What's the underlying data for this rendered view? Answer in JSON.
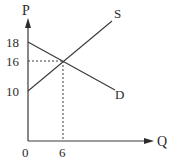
{
  "diagram": {
    "type": "supply-demand",
    "axes": {
      "y_label": "P",
      "x_label": "Q",
      "origin_label": "0"
    },
    "y_ticks": [
      {
        "label": "18",
        "value": 18
      },
      {
        "label": "16",
        "value": 16
      },
      {
        "label": "10",
        "value": 10
      }
    ],
    "x_ticks": [
      {
        "label": "6",
        "value": 6
      }
    ],
    "curves": [
      {
        "name": "S",
        "label": "S",
        "from": [
          0,
          10
        ],
        "direction": "upward"
      },
      {
        "name": "D",
        "label": "D",
        "from": [
          0,
          18
        ],
        "direction": "downward"
      }
    ],
    "equilibrium": {
      "q": 6,
      "p": 16
    },
    "colors": {
      "line": "#3a3a3a",
      "text": "#2b2b2b",
      "background": "#ffffff"
    }
  }
}
